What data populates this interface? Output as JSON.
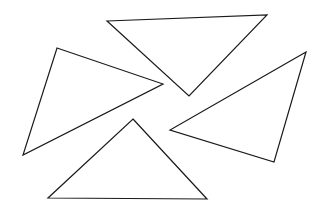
{
  "figure": {
    "canvas": {
      "width": 320,
      "height": 213,
      "background_color": "#ffffff"
    },
    "style": {
      "stroke_color": "#1a1a1a",
      "stroke_width": 1.2,
      "fill": "none"
    },
    "shapes": [
      {
        "name": "triangle-top",
        "label": "Top triangle (downward pointing)",
        "points": "107,21 267,15 189,96",
        "vertices": [
          {
            "x": 107,
            "y": 21
          },
          {
            "x": 267,
            "y": 15
          },
          {
            "x": 189,
            "y": 96
          }
        ]
      },
      {
        "name": "triangle-left",
        "label": "Left triangle (rightward pointing)",
        "points": "57,48 163,84 23,155",
        "vertices": [
          {
            "x": 57,
            "y": 48
          },
          {
            "x": 163,
            "y": 84
          },
          {
            "x": 23,
            "y": 155
          }
        ]
      },
      {
        "name": "triangle-right",
        "label": "Right triangle (leftward pointing)",
        "points": "306,52 170,130 274,162",
        "vertices": [
          {
            "x": 306,
            "y": 52
          },
          {
            "x": 170,
            "y": 130
          },
          {
            "x": 274,
            "y": 162
          }
        ]
      },
      {
        "name": "triangle-bottom",
        "label": "Bottom triangle (upward pointing)",
        "points": "133,119 207,199 48,198",
        "vertices": [
          {
            "x": 133,
            "y": 119
          },
          {
            "x": 207,
            "y": 199
          },
          {
            "x": 48,
            "y": 198
          }
        ]
      }
    ],
    "shape_count": 4
  }
}
